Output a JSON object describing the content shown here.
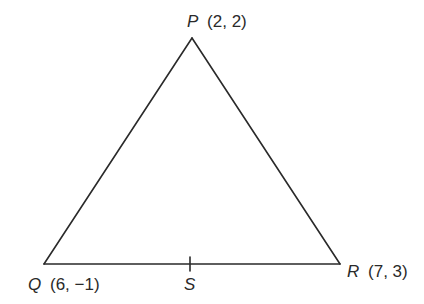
{
  "diagram": {
    "type": "triangle",
    "vertices": [
      {
        "name": "P",
        "coords": "(2, 2)",
        "x": 192,
        "y": 38
      },
      {
        "name": "Q",
        "coords": "(6, −1)",
        "x": 44,
        "y": 264
      },
      {
        "name": "R",
        "coords": "(7, 3)",
        "x": 340,
        "y": 264
      }
    ],
    "points": [
      {
        "name": "S",
        "x": 190,
        "y": 264
      }
    ],
    "labels": {
      "p_name": "P",
      "p_coords": "(2, 2)",
      "q_name": "Q",
      "q_coords": "(6, −1)",
      "r_name": "R",
      "r_coords": "(7, 3)",
      "s_name": "S"
    },
    "colors": {
      "stroke": "#2a2a2a",
      "background": "#ffffff"
    }
  }
}
